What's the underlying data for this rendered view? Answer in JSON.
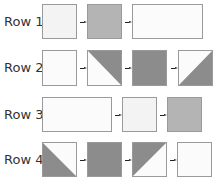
{
  "colors": {
    "light": "#f3f3f3",
    "medium": "#b4b4b4",
    "dark": "#8c8c8c",
    "white": "#fbfbfb",
    "border": "#9a9a9a"
  },
  "rows": [
    {
      "label": "Row 1",
      "y": 4,
      "h": 35,
      "tiles": [
        {
          "x": 42,
          "w": 35,
          "kind": "solid",
          "fill": "light"
        },
        {
          "x": 87,
          "w": 35,
          "kind": "solid",
          "fill": "medium"
        },
        {
          "x": 132,
          "w": 71,
          "kind": "solid",
          "fill": "white"
        }
      ],
      "arrows": [
        80,
        125
      ]
    },
    {
      "label": "Row 2",
      "y": 50,
      "h": 36,
      "tiles": [
        {
          "x": 42,
          "w": 35,
          "kind": "solid",
          "fill": "white"
        },
        {
          "x": 87,
          "w": 35,
          "kind": "diag-tr-dark",
          "fill": "dark"
        },
        {
          "x": 132,
          "w": 35,
          "kind": "solid",
          "fill": "dark"
        },
        {
          "x": 178,
          "w": 35,
          "kind": "diag-br-dark",
          "fill": "dark"
        }
      ],
      "arrows": [
        80,
        125,
        171
      ]
    },
    {
      "label": "Row 3",
      "y": 97,
      "h": 35,
      "tiles": [
        {
          "x": 42,
          "w": 70,
          "kind": "solid",
          "fill": "white"
        },
        {
          "x": 122,
          "w": 35,
          "kind": "solid",
          "fill": "light"
        },
        {
          "x": 167,
          "w": 35,
          "kind": "solid",
          "fill": "medium"
        }
      ],
      "arrows": [
        115,
        160
      ]
    },
    {
      "label": "Row 4",
      "y": 142,
      "h": 35,
      "tiles": [
        {
          "x": 42,
          "w": 35,
          "kind": "diag-bl-dark",
          "fill": "dark"
        },
        {
          "x": 87,
          "w": 35,
          "kind": "solid",
          "fill": "dark"
        },
        {
          "x": 132,
          "w": 35,
          "kind": "diag-tl-dark",
          "fill": "dark"
        },
        {
          "x": 177,
          "w": 35,
          "kind": "solid",
          "fill": "white"
        }
      ],
      "arrows": [
        80,
        125,
        170
      ]
    }
  ]
}
